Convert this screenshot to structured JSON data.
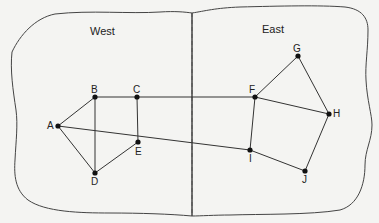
{
  "diagram": {
    "type": "graph",
    "regions": [
      {
        "id": "west",
        "label": "West",
        "x": 90,
        "y": 26
      },
      {
        "id": "east",
        "label": "East",
        "x": 262,
        "y": 24
      }
    ],
    "divider": {
      "style": "dashed",
      "x": 192
    },
    "nodes": [
      {
        "id": "A",
        "label": "A",
        "x": 58,
        "y": 126,
        "lx": 47,
        "ly": 121
      },
      {
        "id": "B",
        "label": "B",
        "x": 95,
        "y": 97,
        "lx": 91,
        "ly": 85
      },
      {
        "id": "C",
        "label": "C",
        "x": 137,
        "y": 97,
        "lx": 133,
        "ly": 85
      },
      {
        "id": "D",
        "label": "D",
        "x": 95,
        "y": 173,
        "lx": 91,
        "ly": 177
      },
      {
        "id": "E",
        "label": "E",
        "x": 138,
        "y": 142,
        "lx": 135,
        "ly": 147
      },
      {
        "id": "F",
        "label": "F",
        "x": 255,
        "y": 97,
        "lx": 249,
        "ly": 85
      },
      {
        "id": "G",
        "label": "G",
        "x": 298,
        "y": 56,
        "lx": 293,
        "ly": 44
      },
      {
        "id": "H",
        "label": "H",
        "x": 329,
        "y": 114,
        "lx": 333,
        "ly": 109
      },
      {
        "id": "I",
        "label": "I",
        "x": 250,
        "y": 150,
        "lx": 249,
        "ly": 154
      },
      {
        "id": "J",
        "label": "J",
        "x": 305,
        "y": 171,
        "lx": 302,
        "ly": 175
      }
    ],
    "edges": [
      [
        "A",
        "B"
      ],
      [
        "A",
        "D"
      ],
      [
        "A",
        "I"
      ],
      [
        "B",
        "C"
      ],
      [
        "B",
        "D"
      ],
      [
        "C",
        "E"
      ],
      [
        "D",
        "E"
      ],
      [
        "C",
        "F"
      ],
      [
        "F",
        "G"
      ],
      [
        "F",
        "H"
      ],
      [
        "G",
        "H"
      ],
      [
        "F",
        "I"
      ],
      [
        "H",
        "J"
      ],
      [
        "I",
        "J"
      ]
    ],
    "colors": {
      "background": "#f4f4f2",
      "line": "#333333",
      "node": "#111111",
      "outline": "#444444"
    }
  }
}
